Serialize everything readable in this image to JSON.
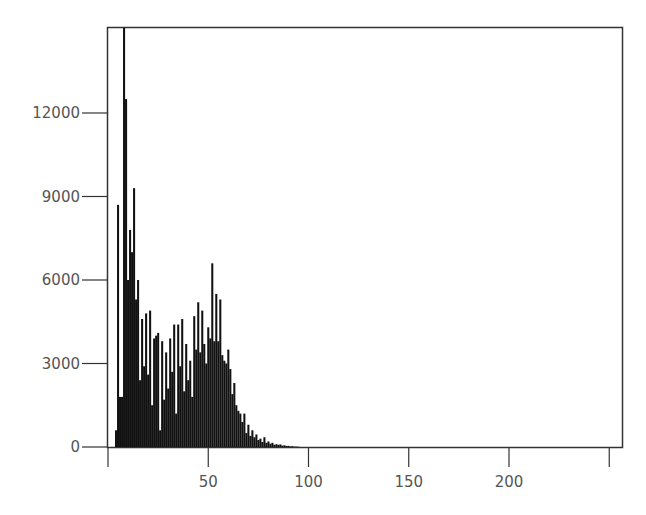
{
  "chart_data": {
    "type": "bar",
    "title": "",
    "xlabel": "",
    "ylabel": "",
    "xlim": [
      0,
      257
    ],
    "ylim": [
      0,
      15000
    ],
    "grid": false,
    "legend": null,
    "x_ticks": [
      0,
      50,
      100,
      150,
      200,
      250
    ],
    "x_tick_labels": [
      "",
      "50",
      "100",
      "150",
      "200",
      ""
    ],
    "y_ticks": [
      0,
      3000,
      6000,
      9000,
      12000
    ],
    "y_tick_labels": [
      "0",
      "3000",
      "6000",
      "9000",
      "12000"
    ],
    "bar_color": "#111111",
    "x": [
      4,
      5,
      6,
      7,
      8,
      9,
      10,
      11,
      12,
      13,
      14,
      15,
      16,
      17,
      18,
      19,
      20,
      21,
      22,
      23,
      24,
      25,
      26,
      27,
      28,
      29,
      30,
      31,
      32,
      33,
      34,
      35,
      36,
      37,
      38,
      39,
      40,
      41,
      42,
      43,
      44,
      45,
      46,
      47,
      48,
      49,
      50,
      51,
      52,
      53,
      54,
      55,
      56,
      57,
      58,
      59,
      60,
      61,
      62,
      63,
      64,
      65,
      66,
      67,
      68,
      69,
      70,
      71,
      72,
      73,
      74,
      75,
      76,
      77,
      78,
      79,
      80,
      81,
      82,
      83,
      84,
      85,
      86,
      87,
      88,
      89,
      90,
      91,
      92,
      93,
      94,
      95
    ],
    "values": [
      600,
      8700,
      1800,
      1800,
      15200,
      12500,
      6000,
      7800,
      7000,
      9300,
      5300,
      6000,
      2400,
      4600,
      2900,
      4800,
      2600,
      4900,
      1500,
      3900,
      4000,
      4100,
      600,
      3800,
      1700,
      3400,
      2100,
      3900,
      2700,
      4400,
      1200,
      4400,
      2900,
      4600,
      2000,
      3700,
      2400,
      3100,
      1800,
      4700,
      3500,
      5200,
      3400,
      4900,
      3700,
      3000,
      4300,
      3900,
      6600,
      3800,
      5500,
      3800,
      5300,
      3300,
      3100,
      3000,
      3500,
      2800,
      1900,
      2300,
      1500,
      1300,
      1200,
      900,
      1200,
      500,
      800,
      400,
      600,
      350,
      450,
      250,
      300,
      180,
      350,
      150,
      200,
      120,
      150,
      80,
      100,
      80,
      90,
      50,
      60,
      40,
      40,
      25,
      30,
      15,
      15,
      10
    ]
  },
  "axes": {
    "y_labels": [
      "12000",
      "9000",
      "6000",
      "3000",
      "0"
    ],
    "x_labels": [
      "50",
      "100",
      "150",
      "200"
    ]
  }
}
